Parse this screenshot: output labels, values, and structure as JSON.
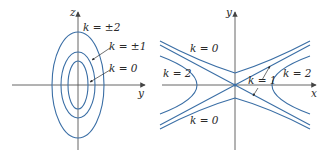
{
  "colors": {
    "curve": "#3a6ea5",
    "axis": "#555555",
    "text": "#2a2a2a"
  },
  "left_plot": {
    "horizontal_axis_label": "y",
    "vertical_axis_label": "z",
    "labels": [
      {
        "text": "k = ±2",
        "x": 83,
        "y": 28
      },
      {
        "text": "k = ±1",
        "x": 109,
        "y": 47
      },
      {
        "text": "k = 0",
        "x": 109,
        "y": 70
      }
    ],
    "ellipses": [
      {
        "name": "k=0",
        "rx": 10,
        "ry": 24
      },
      {
        "name": "k=±1",
        "rx": 17,
        "ry": 33
      },
      {
        "name": "k=±2",
        "rx": 26,
        "ry": 53
      }
    ]
  },
  "right_plot": {
    "horizontal_axis_label": "x",
    "vertical_axis_label": "y",
    "labels": [
      {
        "text": "k = 0",
        "x": 190,
        "y": 50
      },
      {
        "text": "k = 2",
        "x": 163,
        "y": 76
      },
      {
        "text": "k = 1",
        "x": 248,
        "y": 84
      },
      {
        "text": "k = 2",
        "x": 283,
        "y": 76
      },
      {
        "text": "k = 0",
        "x": 190,
        "y": 124
      }
    ]
  }
}
